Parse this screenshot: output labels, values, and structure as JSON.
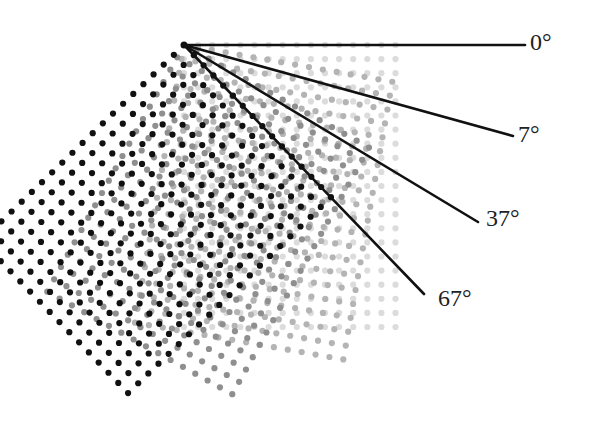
{
  "diagram": {
    "origin": {
      "x": 184,
      "y": 45
    },
    "lattice": {
      "spacing": 14.1,
      "rows": 21,
      "cols": 16,
      "dot_radius": 3.1
    },
    "layers": [
      {
        "name": "lattice-0deg",
        "rotation": 0,
        "color": "#dcdcdc"
      },
      {
        "name": "lattice-7deg",
        "rotation": 10,
        "color": "#b4b4b4"
      },
      {
        "name": "lattice-37deg",
        "rotation": 29,
        "color": "#8f8f8f"
      },
      {
        "name": "lattice-67deg",
        "rotation": 46,
        "color": "#111111"
      }
    ],
    "rays": [
      {
        "name": "ray-0",
        "x2": 525,
        "y2": 45,
        "label": "0°",
        "label_x": 530,
        "label_y": 30
      },
      {
        "name": "ray-7",
        "x2": 513,
        "y2": 136,
        "label": "7°",
        "label_x": 518,
        "label_y": 122
      },
      {
        "name": "ray-37",
        "x2": 478,
        "y2": 222,
        "label": "37°",
        "label_x": 486,
        "label_y": 206
      },
      {
        "name": "ray-67",
        "x2": 424,
        "y2": 294,
        "label": "67°",
        "label_x": 438,
        "label_y": 286
      }
    ],
    "ray_color": "#111111",
    "ray_width": 2.6
  }
}
